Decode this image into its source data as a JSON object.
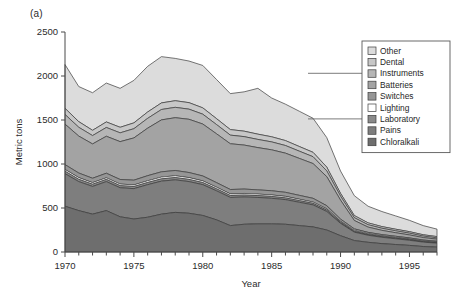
{
  "figure": {
    "panel_label": "(a)",
    "background": "#ffffff"
  },
  "chart_data": {
    "type": "area",
    "stacked": true,
    "title": "",
    "xlabel": "Year",
    "ylabel": "Metric tons",
    "xlim": [
      1970,
      1997
    ],
    "ylim": [
      0,
      2500
    ],
    "yticks": [
      0,
      500,
      1000,
      1500,
      2000,
      2500
    ],
    "ytick_labels": [
      "0",
      "500",
      "1000",
      "1500",
      "2000",
      "2500"
    ],
    "xticks": [
      1970,
      1975,
      1980,
      1985,
      1990,
      1995
    ],
    "xtick_labels": [
      "1970",
      "1975",
      "1980",
      "1985",
      "1990",
      "1995"
    ],
    "minor_xtick_step": 1,
    "grid": false,
    "legend_position": "top-right",
    "x": [
      1970,
      1971,
      1972,
      1973,
      1974,
      1975,
      1976,
      1977,
      1978,
      1979,
      1980,
      1981,
      1982,
      1983,
      1984,
      1985,
      1986,
      1987,
      1988,
      1989,
      1990,
      1991,
      1992,
      1993,
      1994,
      1995,
      1996,
      1997
    ],
    "series": [
      {
        "name": "Chloralkali",
        "color": "#6e6e6e",
        "values": [
          520,
          470,
          430,
          470,
          400,
          375,
          395,
          430,
          450,
          440,
          415,
          365,
          300,
          315,
          320,
          320,
          315,
          300,
          285,
          250,
          185,
          130,
          110,
          95,
          85,
          75,
          62,
          55
        ]
      },
      {
        "name": "Pains",
        "color": "#7e7e7e",
        "values": [
          370,
          330,
          315,
          330,
          330,
          345,
          370,
          375,
          370,
          360,
          350,
          330,
          320,
          310,
          300,
          290,
          280,
          265,
          250,
          210,
          140,
          95,
          80,
          72,
          65,
          58,
          50,
          45
        ]
      },
      {
        "name": "Laboratory",
        "color": "#8a8a8a",
        "values": [
          28,
          26,
          25,
          25,
          24,
          24,
          25,
          26,
          26,
          25,
          24,
          23,
          22,
          22,
          21,
          21,
          20,
          19,
          18,
          16,
          12,
          9,
          8,
          7,
          7,
          6,
          6,
          5
        ]
      },
      {
        "name": "Lighting",
        "color": "#ffffff",
        "values": [
          20,
          19,
          18,
          18,
          18,
          18,
          19,
          20,
          20,
          20,
          19,
          18,
          18,
          18,
          17,
          17,
          17,
          16,
          15,
          14,
          11,
          9,
          8,
          8,
          7,
          7,
          6,
          6
        ]
      },
      {
        "name": "Switches",
        "color": "#969696",
        "values": [
          55,
          52,
          50,
          52,
          52,
          54,
          58,
          60,
          60,
          58,
          56,
          52,
          50,
          50,
          48,
          48,
          46,
          44,
          42,
          36,
          26,
          20,
          17,
          16,
          15,
          14,
          12,
          11
        ]
      },
      {
        "name": "Batteries",
        "color": "#a3a3a3",
        "values": [
          460,
          420,
          390,
          420,
          430,
          480,
          540,
          590,
          600,
          605,
          590,
          555,
          520,
          500,
          480,
          465,
          445,
          420,
          395,
          330,
          215,
          95,
          60,
          48,
          40,
          34,
          28,
          24
        ]
      },
      {
        "name": "Instruments",
        "color": "#b6b6b6",
        "values": [
          110,
          100,
          95,
          100,
          100,
          105,
          112,
          118,
          118,
          115,
          112,
          105,
          98,
          96,
          93,
          90,
          87,
          82,
          78,
          66,
          46,
          32,
          27,
          24,
          22,
          20,
          17,
          15
        ]
      },
      {
        "name": "Dental",
        "color": "#c7c7c7",
        "values": [
          70,
          64,
          60,
          63,
          63,
          66,
          72,
          75,
          75,
          74,
          72,
          67,
          63,
          62,
          60,
          58,
          56,
          53,
          50,
          43,
          31,
          24,
          21,
          19,
          18,
          17,
          15,
          14
        ]
      },
      {
        "name": "Other",
        "color": "#dcdcdc",
        "values": [
          497,
          399,
          427,
          442,
          443,
          483,
          519,
          526,
          481,
          473,
          482,
          445,
          409,
          447,
          521,
          441,
          414,
          401,
          387,
          335,
          254,
          226,
          189,
          171,
          151,
          129,
          104,
          85
        ]
      }
    ],
    "legend_entries": [
      {
        "label": "Other",
        "color": "#dcdcdc"
      },
      {
        "label": "Dental",
        "color": "#c7c7c7"
      },
      {
        "label": "Instruments",
        "color": "#b6b6b6"
      },
      {
        "label": "Batteries",
        "color": "#a3a3a3"
      },
      {
        "label": "Switches",
        "color": "#969696"
      },
      {
        "label": "Lighting",
        "color": "#ffffff"
      },
      {
        "label": "Laboratory",
        "color": "#8a8a8a"
      },
      {
        "label": "Pains",
        "color": "#7e7e7e"
      },
      {
        "label": "Chloralkali",
        "color": "#6e6e6e"
      }
    ]
  }
}
